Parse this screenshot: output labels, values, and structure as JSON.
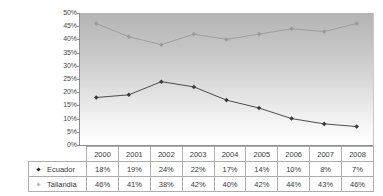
{
  "chart_data": {
    "type": "line",
    "title": "",
    "subtitle": "",
    "xlabel": "",
    "ylabel": "",
    "categories": [
      "2000",
      "2001",
      "2002",
      "2003",
      "2004",
      "2005",
      "2006",
      "2007",
      "2008"
    ],
    "series": [
      {
        "name": "Ecuador",
        "values": [
          18,
          19,
          24,
          22,
          17,
          14,
          10,
          8,
          7
        ],
        "labels": [
          "18%",
          "19%",
          "24%",
          "22%",
          "17%",
          "14%",
          "10%",
          "8%",
          "7%"
        ],
        "color": "#3a3a3a",
        "marker": "diamond"
      },
      {
        "name": "Tailandia",
        "values": [
          46,
          41,
          38,
          42,
          40,
          42,
          44,
          43,
          46
        ],
        "labels": [
          "46%",
          "41%",
          "38%",
          "42%",
          "40%",
          "42%",
          "44%",
          "43%",
          "46%"
        ],
        "color": "#9a9a9a",
        "marker": "diamond"
      }
    ],
    "ylim": [
      0,
      50
    ],
    "yticks": [
      0,
      5,
      10,
      15,
      20,
      25,
      30,
      35,
      40,
      45,
      50
    ],
    "ytick_labels": [
      "0%",
      "5%",
      "10%",
      "15%",
      "20%",
      "25%",
      "30%",
      "35%",
      "40%",
      "45%",
      "50%"
    ],
    "grid": false,
    "legend_position": "data-table-left",
    "plot_background": "gray-vertical-gradient"
  },
  "table": {
    "corner_label": "",
    "header": [
      "2000",
      "2001",
      "2002",
      "2003",
      "2004",
      "2005",
      "2006",
      "2007",
      "2008"
    ],
    "rows": [
      {
        "label": "Ecuador",
        "marker_color": "#222222",
        "cells": [
          "18%",
          "19%",
          "24%",
          "22%",
          "17%",
          "14%",
          "10%",
          "8%",
          "7%"
        ]
      },
      {
        "label": "Tailandia",
        "marker_color": "#b9b9b9",
        "cells": [
          "46%",
          "41%",
          "38%",
          "42%",
          "40%",
          "42%",
          "44%",
          "43%",
          "46%"
        ]
      }
    ]
  }
}
